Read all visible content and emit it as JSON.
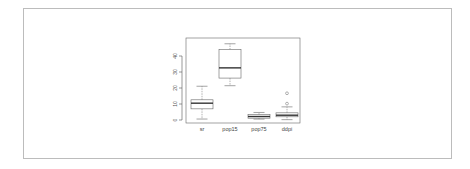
{
  "chart_data": {
    "type": "boxplot",
    "title": "",
    "xlabel": "",
    "ylabel": "",
    "ylim": [
      0,
      48
    ],
    "yticks": [
      0,
      10,
      20,
      30,
      40
    ],
    "ytick_labels": [
      "0",
      "10",
      "20",
      "30",
      "40"
    ],
    "grid": false,
    "legend": null,
    "categories": [
      "sr",
      "pop15",
      "pop75",
      "ddpi"
    ],
    "series": [
      {
        "name": "sr",
        "whisker_low": 0.6,
        "q1": 6.97,
        "median": 10.51,
        "q3": 12.62,
        "whisker_high": 21.1,
        "outliers": []
      },
      {
        "name": "pop15",
        "whisker_low": 21.44,
        "q1": 26.2,
        "median": 32.58,
        "q3": 44.07,
        "whisker_high": 47.64,
        "outliers": []
      },
      {
        "name": "pop75",
        "whisker_low": 0.56,
        "q1": 1.13,
        "median": 2.18,
        "q3": 3.33,
        "whisker_high": 4.7,
        "outliers": []
      },
      {
        "name": "ddpi",
        "whisker_low": 0.22,
        "q1": 2.0,
        "median": 3.0,
        "q3": 4.48,
        "whisker_high": 8.21,
        "outliers": [
          10.23,
          16.71
        ]
      }
    ]
  },
  "colors": {
    "frame": "#bcbcbc",
    "axis": "#555555",
    "box": "#666666",
    "median": "#333333"
  }
}
